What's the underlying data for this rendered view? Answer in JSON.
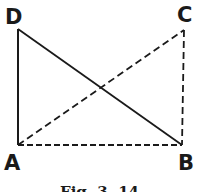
{
  "diagram": {
    "type": "geometry",
    "figure": "rectangle ABCD with diagonals",
    "points": {
      "A": {
        "label": "A",
        "x": 18,
        "y": 145
      },
      "B": {
        "label": "B",
        "x": 182,
        "y": 145
      },
      "C": {
        "label": "C",
        "x": 184,
        "y": 30
      },
      "D": {
        "label": "D",
        "x": 18,
        "y": 29
      }
    },
    "segments": [
      {
        "from": "A",
        "to": "D",
        "style": "solid"
      },
      {
        "from": "D",
        "to": "B",
        "style": "solid"
      },
      {
        "from": "A",
        "to": "B",
        "style": "dashed"
      },
      {
        "from": "A",
        "to": "C",
        "style": "dashed"
      },
      {
        "from": "C",
        "to": "B",
        "style": "dashed"
      }
    ],
    "caption": "Fig. 3. 14"
  }
}
